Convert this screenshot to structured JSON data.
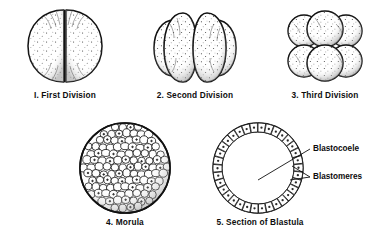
{
  "figure": {
    "background_color": "#ffffff",
    "ink_color": "#111111"
  },
  "panels": [
    {
      "id": "first-division",
      "number": "I.",
      "caption": "I. First Division",
      "stage_name": "First Division",
      "cell_count": 2,
      "description": "Two-cell stage: spherical zygote split by a single vertical cleavage furrow into two equal blastomeres, stippled surface shading."
    },
    {
      "id": "second-division",
      "number": "2.",
      "caption": "2. Second Division",
      "stage_name": "Second Division",
      "cell_count": 4,
      "description": "Four-cell stage: four vertical wedge-shaped blastomeres seen side by side, two forward lobes overlapping two rear lobes."
    },
    {
      "id": "third-division",
      "number": "3.",
      "caption": "3. Third Division",
      "stage_name": "Third Division",
      "cell_count": 8,
      "description": "Eight-cell stage: two stacked tiers of four rounded blastomeres each, upper tier offset above the lower tier."
    },
    {
      "id": "morula",
      "number": "4.",
      "caption": "4. Morula",
      "stage_name": "Morula",
      "cell_count": "many",
      "description": "Solid mulberry-shaped ball densely packed with many small rounded cells, no internal cavity."
    },
    {
      "id": "section-of-blastula",
      "number": "5.",
      "caption": "5. Section of Blastula",
      "stage_name": "Section of Blastula",
      "cell_count": 34,
      "description": "Cross-section showing a single ring of columnar cells enclosing a large hollow fluid-filled cavity."
    }
  ],
  "annotations": [
    {
      "id": "blastocoele",
      "text": "Blastocoele",
      "points_to": "central cavity of the blastula",
      "leader": "single diagonal line to cavity center"
    },
    {
      "id": "blastomeres",
      "text": "Blastomeres",
      "points_to": "cell layer forming the blastula wall",
      "leader": "forked line touching the cell wall at two points"
    }
  ]
}
